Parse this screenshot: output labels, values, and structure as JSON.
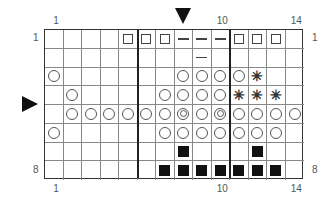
{
  "chart": {
    "columns": 14,
    "rows": 8,
    "top_labels": [
      {
        "text": "1",
        "col": 1
      },
      {
        "text": "10",
        "col": 10
      },
      {
        "text": "14",
        "col": 14
      }
    ],
    "bottom_labels": [
      {
        "text": "1",
        "col": 1
      },
      {
        "text": "10",
        "col": 10
      },
      {
        "text": "14",
        "col": 14
      }
    ],
    "right_labels": [
      {
        "text": "1",
        "row": 1
      },
      {
        "text": "8",
        "row": 8
      }
    ],
    "left_labels": [
      {
        "text": "1",
        "row": 1
      },
      {
        "text": "8",
        "row": 8
      }
    ],
    "thick_lines_after_columns": [
      5,
      10
    ],
    "markers": {
      "top_arrow": {
        "symbol": "down-arrow",
        "col": 8
      },
      "left_arrow": {
        "symbol": "right-arrow",
        "row": 5
      }
    },
    "legend_symbols": {
      "square": "open square",
      "dash": "dash",
      "circle": "open circle",
      "dcircle": "double circle",
      "star": "asterisk",
      "fill": "filled square"
    },
    "cells": [
      [
        "",
        "",
        "",
        "",
        "square",
        "square",
        "square",
        "dash",
        "dash",
        "dash",
        "square",
        "square",
        "square",
        ""
      ],
      [
        "",
        "",
        "",
        "",
        "",
        "",
        "",
        "",
        "dash",
        "",
        "",
        "",
        "",
        ""
      ],
      [
        "circle",
        "",
        "",
        "",
        "",
        "",
        "",
        "circle",
        "circle",
        "circle",
        "circle",
        "star",
        "",
        ""
      ],
      [
        "",
        "circle",
        "",
        "",
        "",
        "",
        "circle",
        "circle",
        "circle",
        "circle",
        "star",
        "star",
        "star",
        ""
      ],
      [
        "",
        "circle",
        "circle",
        "circle",
        "circle",
        "circle",
        "circle",
        "dcircle",
        "circle",
        "dcircle",
        "circle",
        "circle",
        "circle",
        "circle"
      ],
      [
        "circle",
        "",
        "",
        "",
        "",
        "",
        "circle",
        "circle",
        "circle",
        "circle",
        "circle",
        "circle",
        "circle",
        ""
      ],
      [
        "",
        "",
        "",
        "",
        "",
        "",
        "",
        "fill",
        "",
        "",
        "",
        "fill",
        "",
        ""
      ],
      [
        "",
        "",
        "",
        "",
        "",
        "",
        "fill",
        "fill",
        "fill",
        "fill",
        "fill",
        "fill",
        "fill",
        ""
      ]
    ]
  }
}
